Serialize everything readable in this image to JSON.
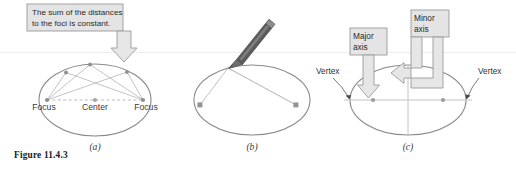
{
  "figure": {
    "caption": "Figure 11.4.3",
    "background": "#ffffff",
    "rule_color": "#eceaea",
    "ink_color": "#7d7d7d",
    "callout_fill": "#e2e2e2",
    "callout_stroke": "#9a9a9a",
    "arrow_fill": "#e6e6e6",
    "arrow_stroke": "#9a9a9a",
    "pencil_color": "#4f4f4f"
  },
  "panels": [
    {
      "id": "a",
      "label": "(a)",
      "callout": {
        "line1": "The sum of the distances",
        "line2": "to the foci is constant."
      },
      "labels": {
        "left_focus": "Focus",
        "center": "Center",
        "right_focus": "Focus"
      }
    },
    {
      "id": "b",
      "label": "(b)",
      "tool": "pencil"
    },
    {
      "id": "c",
      "label": "(c)",
      "callouts": {
        "major_line1": "Major",
        "major_line2": "axis",
        "minor_line1": "Minor",
        "minor_line2": "axis"
      },
      "labels": {
        "left_vertex": "Vertex",
        "right_vertex": "Vertex"
      }
    }
  ]
}
